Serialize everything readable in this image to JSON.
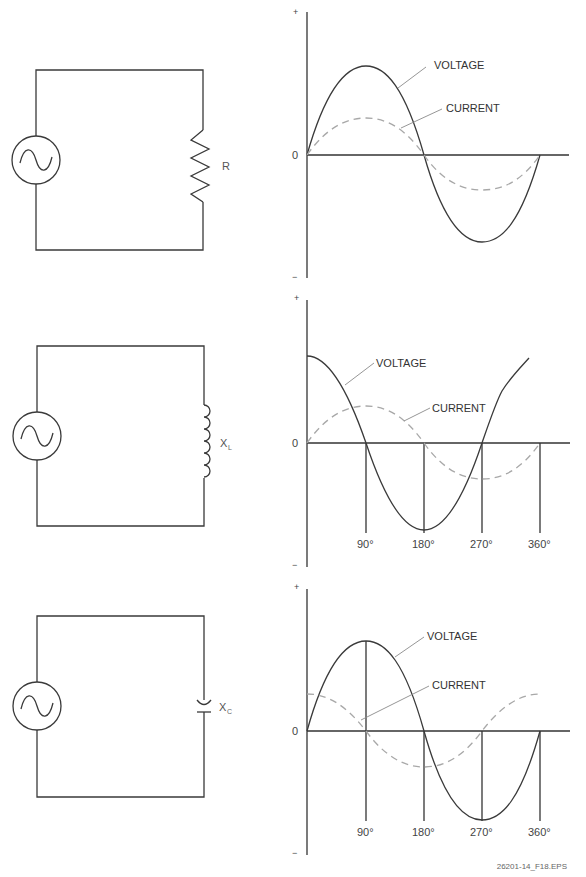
{
  "figure_id": "26201-14_F18.EPS",
  "colors": {
    "line": "#3a3a3a",
    "current_dashed": "#a8a8a8",
    "leader": "#8a8a8a",
    "background": "#ffffff"
  },
  "panels": [
    {
      "circuit": {
        "component": "resistor",
        "label": "R",
        "label_sub": ""
      },
      "graph": {
        "plus": "+",
        "minus": "−",
        "zero": "0",
        "voltage_label": "VOLTAGE",
        "current_label": "CURRENT",
        "phase": "in phase",
        "ticks": []
      }
    },
    {
      "circuit": {
        "component": "inductor",
        "label": "X",
        "label_sub": "L"
      },
      "graph": {
        "plus": "+",
        "minus": "−",
        "zero": "0",
        "voltage_label": "VOLTAGE",
        "current_label": "CURRENT",
        "phase": "voltage leads current by 90°",
        "ticks": [
          "90°",
          "180°",
          "270°",
          "360°"
        ]
      }
    },
    {
      "circuit": {
        "component": "capacitor",
        "label": "X",
        "label_sub": "C"
      },
      "graph": {
        "plus": "+",
        "minus": "−",
        "zero": "0",
        "voltage_label": "VOLTAGE",
        "current_label": "CURRENT",
        "phase": "current leads voltage by 90°",
        "ticks": [
          "90°",
          "180°",
          "270°",
          "360°"
        ]
      }
    }
  ]
}
